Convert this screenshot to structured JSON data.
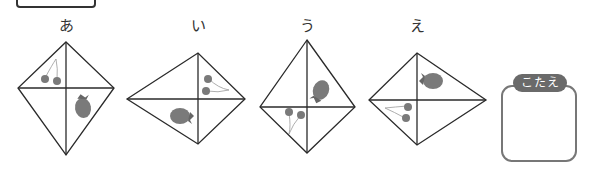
{
  "options": [
    {
      "label": "あ",
      "fruits": [
        "cherries",
        "strawberry"
      ]
    },
    {
      "label": "い",
      "fruits": [
        "cherries",
        "strawberry"
      ]
    },
    {
      "label": "う",
      "fruits": [
        "strawberry",
        "cherries"
      ]
    },
    {
      "label": "え",
      "fruits": [
        "strawberry",
        "cherries"
      ]
    }
  ],
  "answer": {
    "label": "こたえ",
    "value": ""
  },
  "colors": {
    "line": "#2a2a2a",
    "fruit": "#7a7a7a",
    "pill": "#6a6a6a",
    "box_border": "#777777"
  }
}
